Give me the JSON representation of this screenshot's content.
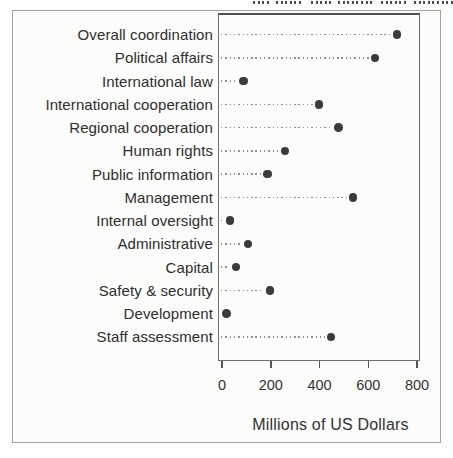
{
  "figure": {
    "kind": "scanned-book-figure",
    "xaxis_label": "Millions of US Dollars"
  },
  "chart_data": {
    "type": "scatter",
    "variant": "horizontal-dot-plot",
    "title": "",
    "xlabel": "Millions of US Dollars",
    "ylabel": "",
    "xlim": [
      0,
      800
    ],
    "xticks": [
      0,
      200,
      400,
      600,
      800
    ],
    "legend": "none",
    "grid": "dotted leader line from left axis to each point",
    "categories": [
      "Overall coordination",
      "Political affairs",
      "International law",
      "International cooperation",
      "Regional cooperation",
      "Human rights",
      "Public information",
      "Management",
      "Internal oversight",
      "Administrative",
      "Capital",
      "Safety & security",
      "Development",
      "Staff assessment"
    ],
    "values": [
      720,
      630,
      90,
      400,
      480,
      260,
      190,
      540,
      35,
      110,
      60,
      200,
      20,
      450
    ],
    "dot_color": "#3b3b3b",
    "leader_dot_color": "#8f8f8f",
    "frame_color": "#6e6e6e"
  }
}
